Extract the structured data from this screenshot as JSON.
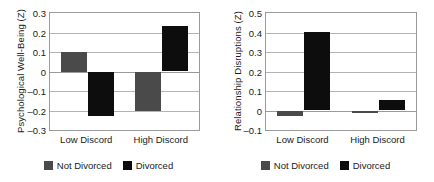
{
  "figure": {
    "panels": [
      {
        "id": "psychological-well-being",
        "ylabel": "Psychological Well-Being (Z)",
        "yticks": [
          "0.3",
          "0.2",
          "0.1",
          "0",
          "-0.1",
          "-0.2",
          "-0.3"
        ],
        "xticks": [
          "Low Discord",
          "High Discord"
        ],
        "legend": [
          {
            "label": "Not Divorced",
            "color": "#4a4a4a"
          },
          {
            "label": "Divorced",
            "color": "#0d0d0d"
          }
        ]
      },
      {
        "id": "relationship-disruptions",
        "ylabel": "Relationship Disruptions (Z)",
        "yticks": [
          "0.5",
          "0.4",
          "0.3",
          "0.2",
          "0.1",
          "0",
          "-0.1"
        ],
        "xticks": [
          "Low Discord",
          "High Discord"
        ],
        "legend": [
          {
            "label": "Not Divorced",
            "color": "#4a4a4a"
          },
          {
            "label": "Divorced",
            "color": "#0d0d0d"
          }
        ]
      }
    ]
  },
  "chart_data": [
    {
      "type": "bar",
      "title": "",
      "xlabel": "",
      "ylabel": "Psychological Well-Being (Z)",
      "categories": [
        "Low Discord",
        "High Discord"
      ],
      "series": [
        {
          "name": "Not Divorced",
          "color": "#4a4a4a",
          "values": [
            0.1,
            -0.2
          ]
        },
        {
          "name": "Divorced",
          "color": "#0d0d0d",
          "values": [
            -0.23,
            0.235
          ]
        }
      ],
      "ylim": [
        -0.3,
        0.3
      ],
      "ytick_step": 0.1,
      "grid": true,
      "legend_position": "bottom"
    },
    {
      "type": "bar",
      "title": "",
      "xlabel": "",
      "ylabel": "Relationship Disruptions (Z)",
      "categories": [
        "Low Discord",
        "High Discord"
      ],
      "series": [
        {
          "name": "Not Divorced",
          "color": "#4a4a4a",
          "values": [
            -0.03,
            -0.012
          ]
        },
        {
          "name": "Divorced",
          "color": "#0d0d0d",
          "values": [
            0.405,
            0.055
          ]
        }
      ],
      "ylim": [
        -0.1,
        0.5
      ],
      "ytick_step": 0.1,
      "grid": true,
      "legend_position": "bottom"
    }
  ]
}
